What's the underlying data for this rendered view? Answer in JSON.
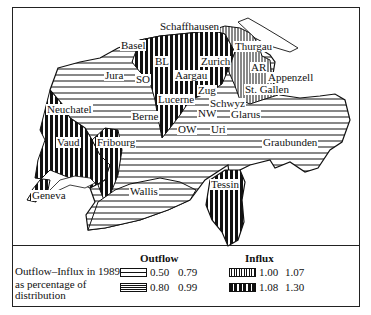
{
  "map": {
    "title": "Outflow–Influx in 1989 as percentage of distribution",
    "regions": [
      {
        "name": "Schaffhausen",
        "category": "influx_low"
      },
      {
        "name": "Basel",
        "category": "influx_high"
      },
      {
        "name": "BL",
        "category": "influx_high"
      },
      {
        "name": "Thurgau",
        "category": "influx_low"
      },
      {
        "name": "Zurich",
        "category": "influx_high"
      },
      {
        "name": "Aargau",
        "category": "influx_high"
      },
      {
        "name": "AR",
        "category": "outflow_high"
      },
      {
        "name": "Appenzell",
        "category": "outflow_high"
      },
      {
        "name": "Jura",
        "category": "outflow_high"
      },
      {
        "name": "SO",
        "category": "influx_high"
      },
      {
        "name": "Zug",
        "category": "influx_high"
      },
      {
        "name": "St. Gallen",
        "category": "influx_low"
      },
      {
        "name": "Lucerne",
        "category": "influx_high"
      },
      {
        "name": "Schwyz",
        "category": "influx_high"
      },
      {
        "name": "Neuchatel",
        "category": "influx_low"
      },
      {
        "name": "NW",
        "category": "outflow_high"
      },
      {
        "name": "Glarus",
        "category": "outflow_high"
      },
      {
        "name": "Berne",
        "category": "outflow_high"
      },
      {
        "name": "OW",
        "category": "outflow_high"
      },
      {
        "name": "Uri",
        "category": "outflow_high"
      },
      {
        "name": "Vaud",
        "category": "influx_high"
      },
      {
        "name": "Fribourg",
        "category": "influx_high"
      },
      {
        "name": "Graubunden",
        "category": "outflow_high"
      },
      {
        "name": "Tessin",
        "category": "influx_high"
      },
      {
        "name": "Wallis",
        "category": "outflow_high"
      },
      {
        "name": "Geneva",
        "category": "influx_high"
      }
    ]
  },
  "labels": {
    "schaffhausen": "Schaffhausen",
    "basel": "Basel",
    "bl": "BL",
    "thurgau": "Thurgau",
    "zurich": "Zurich",
    "aargau": "Aargau",
    "ar": "AR",
    "appenzell": "Appenzell",
    "jura": "Jura",
    "so": "SO",
    "zug": "Zug",
    "stgallen": "St. Gallen",
    "lucerne": "Lucerne",
    "schwyz": "Schwyz",
    "neuchatel": "Neuchatel",
    "nw": "NW",
    "glarus": "Glarus",
    "berne": "Berne",
    "ow": "OW",
    "uri": "Uri",
    "vaud": "Vaud",
    "fribourg": "Fribourg",
    "graubunden": "Graubunden",
    "tessin": "Tessin",
    "wallis": "Wallis",
    "geneva": "Geneva"
  },
  "legend": {
    "description_line1": "Outflow–Influx in 1989",
    "description_line2": "as percentage of",
    "description_line3": "distribution",
    "outflow_title": "Outflow",
    "influx_title": "Influx",
    "outflow_items": [
      {
        "low": "0.50",
        "high": "0.79",
        "pattern": "sparse-horizontal"
      },
      {
        "low": "0.80",
        "high": "0.99",
        "pattern": "dense-horizontal"
      }
    ],
    "influx_items": [
      {
        "low": "1.00",
        "high": "1.07",
        "pattern": "thin-vertical"
      },
      {
        "low": "1.08",
        "high": "1.30",
        "pattern": "bold-vertical"
      }
    ]
  }
}
